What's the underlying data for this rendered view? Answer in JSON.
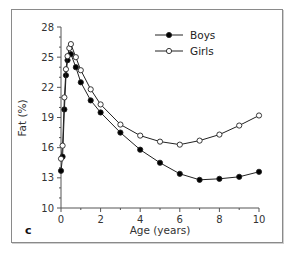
{
  "chart_data": {
    "type": "line",
    "title": "",
    "panel_label": "c",
    "xlabel": "Age (years)",
    "ylabel": "Fat (%)",
    "xlim": [
      0,
      10
    ],
    "ylim": [
      10,
      28
    ],
    "xticks": [
      0,
      2,
      4,
      6,
      8,
      10
    ],
    "yticks": [
      10,
      13,
      16,
      19,
      22,
      25,
      28
    ],
    "grid": false,
    "legend_position": "upper right",
    "series": [
      {
        "name": "Boys",
        "marker": "filled-circle",
        "color": "#000000",
        "x": [
          0,
          0.08,
          0.17,
          0.25,
          0.33,
          0.5,
          0.75,
          1,
          1.5,
          2,
          3,
          4,
          5,
          6,
          7,
          8,
          9,
          10
        ],
        "y": [
          13.7,
          15.1,
          19.8,
          23.2,
          24.7,
          25.3,
          24.0,
          22.5,
          20.7,
          19.5,
          17.5,
          15.8,
          14.5,
          13.4,
          12.8,
          12.9,
          13.1,
          13.6
        ]
      },
      {
        "name": "Girls",
        "marker": "open-circle",
        "color": "#000000",
        "x": [
          0,
          0.08,
          0.17,
          0.25,
          0.33,
          0.42,
          0.5,
          0.75,
          1,
          1.5,
          2,
          3,
          4,
          5,
          6,
          7,
          8,
          9,
          10
        ],
        "y": [
          14.9,
          16.2,
          21.0,
          23.8,
          25.1,
          25.9,
          26.3,
          25.0,
          23.7,
          21.8,
          20.3,
          18.3,
          17.2,
          16.6,
          16.3,
          16.7,
          17.3,
          18.2,
          19.2
        ]
      }
    ]
  }
}
